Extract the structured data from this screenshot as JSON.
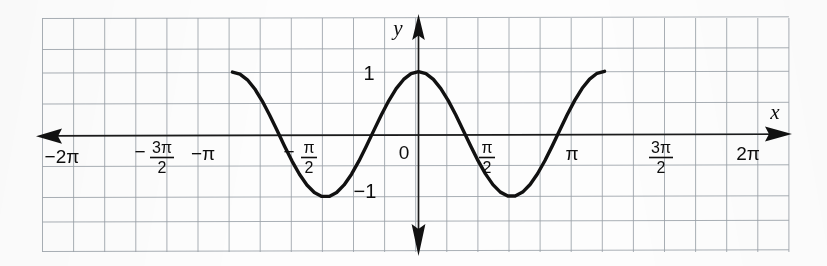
{
  "chart_data": {
    "type": "line",
    "title": "",
    "subtitle": "",
    "function": "y = cos x",
    "xlabel": "x",
    "ylabel": "y",
    "xlim": [
      -6.283185307,
      6.283185307
    ],
    "ylim": [
      -1.85,
      1.9
    ],
    "grid": true,
    "legend": null,
    "x_ticks": [
      {
        "value": -6.283185307,
        "label": "−2π",
        "type": "plain"
      },
      {
        "value": -4.71238898,
        "label": "− 3π/2",
        "type": "fraction",
        "sign": "−",
        "numerator": "3π",
        "denominator": "2"
      },
      {
        "value": -3.141592653,
        "label": "−π",
        "type": "plain"
      },
      {
        "value": -1.570796326,
        "label": "− π/2",
        "type": "fraction",
        "sign": "−",
        "numerator": "π",
        "denominator": "2"
      },
      {
        "value": 0.0,
        "label": "0",
        "type": "origin"
      },
      {
        "value": 1.570796326,
        "label": "π/2",
        "type": "fraction",
        "sign": "",
        "numerator": "π",
        "denominator": "2"
      },
      {
        "value": 3.141592653,
        "label": "π",
        "type": "plain"
      },
      {
        "value": 4.71238898,
        "label": "3π/2",
        "type": "fraction",
        "sign": "",
        "numerator": "3π",
        "denominator": "2"
      },
      {
        "value": 6.283185307,
        "label": "2π",
        "type": "plain"
      }
    ],
    "y_ticks": [
      {
        "value": 1,
        "label": "1"
      },
      {
        "value": -1,
        "label": "−1"
      }
    ],
    "series": [
      {
        "name": "y = cos x",
        "color": "#111111",
        "points_x": [
          -6.2832,
          -6.0319,
          -5.7805,
          -5.5292,
          -5.2779,
          -5.0265,
          -4.7752,
          -4.5239,
          -4.2726,
          -4.0212,
          -3.7699,
          -3.5186,
          -3.2673,
          -3.0159,
          -2.7646,
          -2.5133,
          -2.2619,
          -2.0106,
          -1.7593,
          -1.508,
          -1.2566,
          -1.0053,
          -0.754,
          -0.5027,
          -0.2513,
          0.0,
          0.2513,
          0.5027,
          0.754,
          1.0053,
          1.2566,
          1.508,
          1.7593,
          2.0106,
          2.2619,
          2.5133,
          2.7646,
          3.0159,
          3.2673,
          3.5186,
          3.7699,
          4.0212,
          4.2726,
          4.5239,
          4.7752,
          5.0265,
          5.2779,
          5.5292,
          5.7805,
          6.0319,
          6.2832
        ],
        "points_y": [
          1.0,
          0.9686,
          0.8763,
          0.729,
          0.5358,
          0.309,
          0.0628,
          -0.1874,
          -0.4258,
          -0.6374,
          -0.809,
          -0.9298,
          -0.9921,
          -0.9921,
          -0.9298,
          -0.809,
          -0.6374,
          -0.4258,
          -0.1874,
          0.0628,
          0.309,
          0.5358,
          0.729,
          0.8763,
          0.9686,
          1.0,
          0.9686,
          0.8763,
          0.729,
          0.5358,
          0.309,
          0.0628,
          -0.1874,
          -0.4258,
          -0.6374,
          -0.809,
          -0.9298,
          -0.9921,
          -0.9921,
          -0.9298,
          -0.809,
          -0.6374,
          -0.4258,
          -0.1874,
          0.0628,
          0.309,
          0.5358,
          0.729,
          0.8763,
          0.9686,
          1.0
        ]
      }
    ],
    "annotations": [
      {
        "name": "x-axis-label",
        "text": "x"
      },
      {
        "name": "y-axis-label",
        "text": "y"
      },
      {
        "name": "origin-label",
        "text": "0"
      }
    ],
    "axis_arrows": {
      "x_left": true,
      "x_right": true,
      "y_up": true,
      "y_down": true
    },
    "colors": {
      "curve": "#111111",
      "axis": "#1b1b1b",
      "grid_major": "#8f939c",
      "grid_minor": "#b9bdc6",
      "text": "#0d0d0d",
      "background": "#fdfdfd"
    }
  }
}
